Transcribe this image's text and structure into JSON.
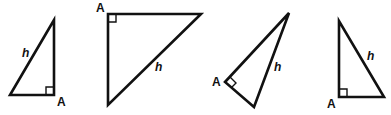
{
  "figure": {
    "stroke_color": "#111111",
    "background": "#ffffff",
    "triangles": [
      {
        "id": 1,
        "hypotenuse_label": "h",
        "right_angle_label": "A",
        "points": "54,20 10,95 54,95",
        "marker": "M46,95 L46,87 L54,87",
        "h_pos": [
          22,
          57
        ],
        "a_pos": [
          57,
          106
        ]
      },
      {
        "id": 2,
        "hypotenuse_label": "h",
        "right_angle_label": "A",
        "points": "108,14 201,14 108,105",
        "marker": "M108,22 L116,22 L116,14",
        "h_pos": [
          155,
          71
        ],
        "a_pos": [
          96,
          12
        ]
      },
      {
        "id": 3,
        "hypotenuse_label": "h",
        "right_angle_label": "A",
        "points": "289,13 225,82 254,107",
        "marker": "M230,77 L236,83 L231,88",
        "h_pos": [
          274,
          71
        ],
        "a_pos": [
          212,
          86
        ]
      },
      {
        "id": 4,
        "hypotenuse_label": "h",
        "right_angle_label": "A",
        "points": "339,21 339,97 384,97",
        "marker": "M339,89 L347,89 L347,97",
        "h_pos": [
          367,
          60
        ],
        "a_pos": [
          327,
          108
        ]
      }
    ]
  }
}
